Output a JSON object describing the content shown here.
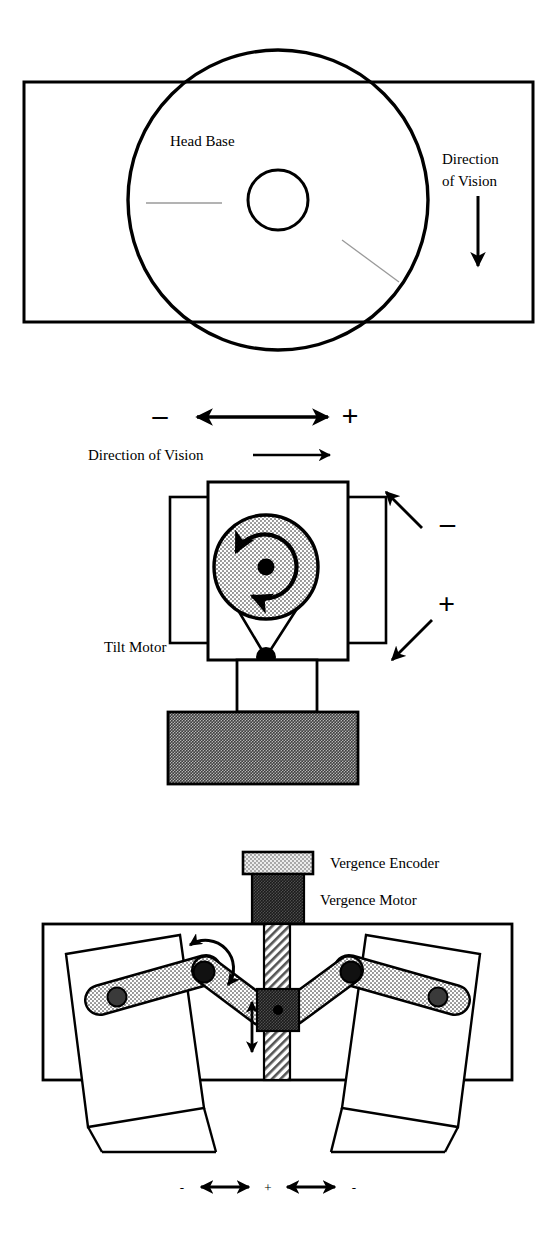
{
  "figure": {
    "background_color": "#ffffff",
    "line_color": "#000000",
    "panels": [
      {
        "id": "top-view",
        "name": "Head base top view",
        "labels": {
          "head_base": "Head Base",
          "direction_of_vision_line1": "Direction",
          "direction_of_vision_line2": "of Vision"
        }
      },
      {
        "id": "side-view",
        "name": "Tilt motor side view",
        "labels": {
          "direction_of_vision": "Direction of Vision",
          "tilt_motor": "Tilt Motor",
          "pan_minus": "–",
          "pan_plus": "+",
          "tilt_minus": "–",
          "tilt_plus": "+"
        }
      },
      {
        "id": "vergence-view",
        "name": "Vergence mechanism front view",
        "labels": {
          "vergence_encoder": "Vergence Encoder",
          "vergence_motor": "Vergence Motor",
          "left_minus": "-",
          "center_plus": "+",
          "right_minus": "-"
        }
      }
    ],
    "colors": {
      "stroke": "#000000",
      "fill_white": "#ffffff",
      "fill_light_stipple": "#cfcfcf",
      "fill_mid_gray": "#9a9a9a",
      "fill_dark_gray": "#4a4a4a",
      "fill_black": "#000000",
      "hairline": "#808080"
    }
  }
}
